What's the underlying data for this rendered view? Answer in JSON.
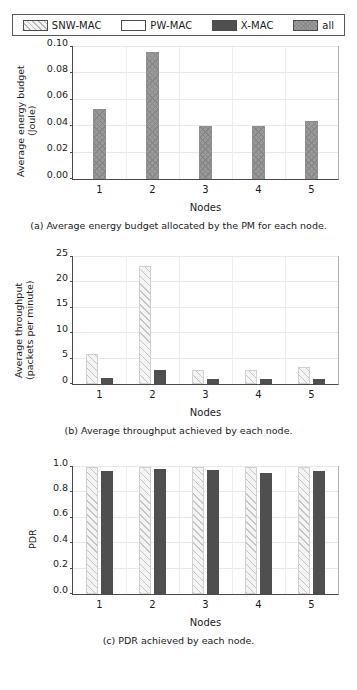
{
  "legend": {
    "entries": [
      {
        "label": "SNW-MAC",
        "style": "hatch-light",
        "color": "#f2f2f2"
      },
      {
        "label": "PW-MAC",
        "style": "empty",
        "color": "#ffffff"
      },
      {
        "label": "X-MAC",
        "style": "solid-dark",
        "color": "#4f4f4f"
      },
      {
        "label": "all",
        "style": "crosshatch-gray",
        "color": "#9c9c9c"
      }
    ]
  },
  "chart_data": [
    {
      "id": "a",
      "type": "bar",
      "title": "",
      "caption": "(a) Average energy budget allocated by the PM for each node.",
      "xlabel": "Nodes",
      "ylabel": "Average energy budget\n(Joule)",
      "categories": [
        "1",
        "2",
        "3",
        "4",
        "5"
      ],
      "yticks": [
        0.0,
        0.02,
        0.04,
        0.06,
        0.08,
        0.1
      ],
      "ytick_labels": [
        "0.00",
        "0.02",
        "0.04",
        "0.06",
        "0.08",
        "0.10"
      ],
      "ylim": [
        0.0,
        0.1
      ],
      "grid": true,
      "legend_position": "figure-top",
      "series": [
        {
          "name": "all",
          "values": [
            0.053,
            0.096,
            0.04,
            0.04,
            0.044
          ]
        }
      ]
    },
    {
      "id": "b",
      "type": "bar",
      "title": "",
      "caption": "(b) Average throughput achieved by each node.",
      "xlabel": "Nodes",
      "ylabel": "Average throughput\n(packets per minute)",
      "categories": [
        "1",
        "2",
        "3",
        "4",
        "5"
      ],
      "yticks": [
        0,
        5,
        10,
        15,
        20,
        25
      ],
      "ytick_labels": [
        "0",
        "5",
        "10",
        "15",
        "20",
        "25"
      ],
      "ylim": [
        0,
        25
      ],
      "grid": true,
      "legend_position": "figure-top",
      "series": [
        {
          "name": "SNW-MAC",
          "values": [
            6.0,
            23.3,
            2.7,
            2.7,
            3.4
          ]
        },
        {
          "name": "X-MAC",
          "values": [
            1.1,
            2.7,
            1.0,
            1.0,
            0.95
          ]
        }
      ]
    },
    {
      "id": "c",
      "type": "bar",
      "title": "",
      "caption": "(c) PDR achieved by each node.",
      "xlabel": "Nodes",
      "ylabel": "PDR",
      "categories": [
        "1",
        "2",
        "3",
        "4",
        "5"
      ],
      "yticks": [
        0.0,
        0.2,
        0.4,
        0.6,
        0.8,
        1.0
      ],
      "ytick_labels": [
        "0.0",
        "0.2",
        "0.4",
        "0.6",
        "0.8",
        "1.0"
      ],
      "ylim": [
        0.0,
        1.0
      ],
      "grid": true,
      "legend_position": "figure-top",
      "series": [
        {
          "name": "SNW-MAC",
          "values": [
            1.0,
            1.0,
            1.0,
            1.0,
            1.0
          ]
        },
        {
          "name": "X-MAC",
          "values": [
            0.972,
            0.983,
            0.975,
            0.955,
            0.968
          ]
        }
      ]
    }
  ]
}
